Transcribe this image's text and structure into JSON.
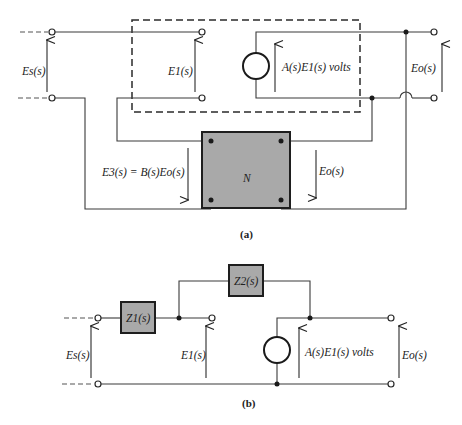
{
  "figure_a": {
    "caption": "(a)",
    "labels": {
      "source_voltage": "Es(s)",
      "input_voltage": "E1(s)",
      "dependent_source": "A(s)E1(s) volts",
      "output_voltage": "Eo(s)",
      "feedback_voltage": "E3(s) = B(s)Eo(s)",
      "network_output_voltage": "Eo(s)",
      "network": "N"
    }
  },
  "figure_b": {
    "caption": "(b)",
    "labels": {
      "source_voltage": "Es(s)",
      "impedance_1": "Z1(s)",
      "impedance_2": "Z2(s)",
      "input_voltage": "E1(s)",
      "dependent_source": "A(s)E1(s) volts",
      "output_voltage": "Eo(s)"
    }
  },
  "colors": {
    "box_fill": "#a9a9a9",
    "wire": "#3a3a3a",
    "background": "#ffffff"
  }
}
